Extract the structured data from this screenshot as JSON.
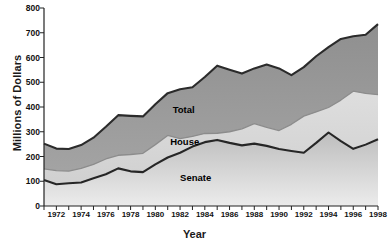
{
  "chart_data": {
    "type": "area",
    "stacked_style": "cumulative-bands",
    "title": "",
    "xlabel": "Year",
    "ylabel": "Millions of Dollars",
    "xlim": [
      1971,
      1998
    ],
    "ylim": [
      0,
      800
    ],
    "yticks": [
      0,
      100,
      200,
      300,
      400,
      500,
      600,
      700,
      800
    ],
    "xticks": [
      1971,
      1972,
      1973,
      1974,
      1975,
      1976,
      1977,
      1978,
      1979,
      1980,
      1981,
      1982,
      1983,
      1984,
      1985,
      1986,
      1987,
      1988,
      1989,
      1990,
      1991,
      1992,
      1993,
      1994,
      1995,
      1996,
      1997,
      1998
    ],
    "xtick_labels": [
      "",
      "1972",
      "",
      "1974",
      "",
      "1976",
      "",
      "1978",
      "",
      "1980",
      "",
      "1982",
      "",
      "1984",
      "",
      "1986",
      "",
      "1988",
      "",
      "1990",
      "",
      "1992",
      "",
      "1994",
      "",
      "1996",
      "",
      "1998"
    ],
    "grid": false,
    "legend_position": "inline-annotations",
    "x": [
      1971,
      1972,
      1973,
      1974,
      1975,
      1976,
      1977,
      1978,
      1979,
      1980,
      1981,
      1982,
      1983,
      1984,
      1985,
      1986,
      1987,
      1988,
      1989,
      1990,
      1991,
      1992,
      1993,
      1994,
      1995,
      1996,
      1997,
      1998
    ],
    "series": [
      {
        "name": "Senate",
        "label_text": "Senate",
        "fill_color": "#cfcfcf",
        "line_color": "#262626",
        "values": [
          105,
          88,
          92,
          95,
          112,
          128,
          152,
          140,
          137,
          168,
          196,
          215,
          240,
          258,
          267,
          255,
          245,
          252,
          243,
          230,
          222,
          215,
          255,
          297,
          262,
          231,
          248,
          270
        ]
      },
      {
        "name": "House",
        "label_text": "House",
        "fill_color": "#d9d9d9",
        "line_color": "#8c8c8c",
        "values": [
          150,
          143,
          141,
          152,
          168,
          190,
          205,
          208,
          213,
          248,
          285,
          272,
          281,
          293,
          294,
          300,
          312,
          333,
          318,
          305,
          330,
          363,
          380,
          398,
          428,
          464,
          455,
          450
        ]
      },
      {
        "name": "Total",
        "label_text": "Total",
        "fill_color": "#9b9b9b",
        "line_color": "#2b2b2b",
        "values": [
          252,
          232,
          230,
          246,
          276,
          320,
          367,
          364,
          362,
          411,
          456,
          472,
          480,
          521,
          567,
          551,
          535,
          556,
          572,
          556,
          529,
          561,
          605,
          642,
          675,
          686,
          692,
          735
        ]
      }
    ],
    "annotations": [
      {
        "text": "Total",
        "x": 1981.4,
        "y": 388
      },
      {
        "text": "House",
        "x": 1981.2,
        "y": 258
      },
      {
        "text": "Senate",
        "x": 1982.0,
        "y": 113
      }
    ]
  },
  "axis": {
    "y_title": "Millions of Dollars",
    "x_title": "Year"
  }
}
